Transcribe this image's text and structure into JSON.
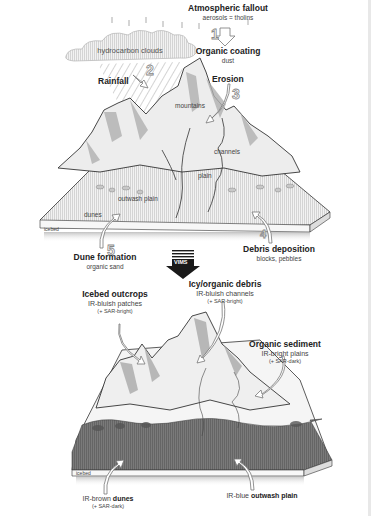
{
  "top_panel": {
    "atmospheric_fallout": {
      "title": "Atmospheric fallout",
      "subtitle": "aerosols = tholins",
      "step": "1"
    },
    "organic_coating": {
      "title": "Organic coating",
      "subtitle": "dust"
    },
    "clouds_label": "hydrocarbon clouds",
    "rainfall": {
      "title": "Rainfall",
      "step": "2"
    },
    "erosion": {
      "title": "Erosion",
      "step": "3"
    },
    "inline_labels": {
      "mountains": "mountains",
      "channels": "channels",
      "plain": "plain",
      "outwash_plain": "outwash plain",
      "dunes": "dunes",
      "icebed": "icebed"
    },
    "dune_formation": {
      "title": "Dune formation",
      "subtitle": "organic sand",
      "step": "5"
    },
    "debris_deposition": {
      "title": "Debris deposition",
      "subtitle": "blocks, pebbles",
      "step": "4"
    }
  },
  "transition_arrow": {
    "label": "VIMS"
  },
  "bottom_panel": {
    "icebed_outcrops": {
      "title": "Icebed outcrops",
      "line1": "IR-bluish patches",
      "line2": "(+ SAR-bright)"
    },
    "icy_organic_debris": {
      "title": "Icy/organic debris",
      "line1": "IR-bluish channels",
      "line2": "(+ SAR-bright)"
    },
    "organic_sediment": {
      "title": "Organic sediment",
      "line1": "IR-bright plains",
      "line2": "(+ SAR-dark)"
    },
    "dunes": {
      "prefix": "IR-brown ",
      "title": "dunes",
      "line2": "(+ SAR-dark)"
    },
    "outwash_plain": {
      "prefix": "IR-blue ",
      "title": "outwash plain"
    },
    "icebed_label": "icebed"
  },
  "colors": {
    "ground_light": "#e9e9e9",
    "ground_dark": "#6e6e6e",
    "mountain_shade": "#a9a9a9",
    "outline": "#333333",
    "arrow_fill": "#1a1a1a"
  }
}
